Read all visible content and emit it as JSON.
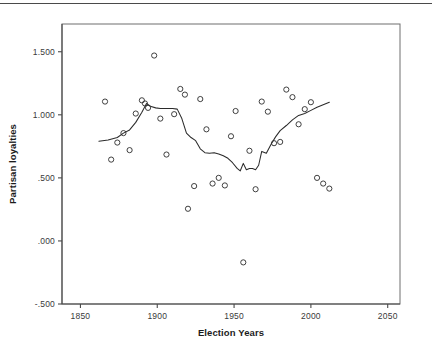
{
  "figure": {
    "background_color": "#ffffff",
    "frame_color": "#6e6e6e",
    "marker_color": "#2b2b2b",
    "line_color": "#2b2b2b"
  },
  "axes": {
    "x_title": "Election Years",
    "y_title": "Partisan loyalties",
    "x_ticks": [
      "1850",
      "1900",
      "1950",
      "2000",
      "2050"
    ],
    "y_ticks": [
      "1.500",
      "1.000",
      ".500",
      ".000",
      "-.500"
    ]
  },
  "chart_data": {
    "type": "scatter",
    "title": "",
    "xlabel": "Election Years",
    "ylabel": "Partisan loyalties",
    "xlim": [
      1838,
      2058
    ],
    "ylim": [
      -0.5,
      1.72
    ],
    "xticks": [
      1850,
      1900,
      1950,
      2000,
      2050
    ],
    "yticks": [
      -0.5,
      0.0,
      0.5,
      1.0,
      1.5
    ],
    "ytick_labels": [
      "-.500",
      ".000",
      ".500",
      "1.000",
      "1.500"
    ],
    "xtick_labels": [
      "1850",
      "1900",
      "1950",
      "2000",
      "2050"
    ],
    "grid": false,
    "legend": "none",
    "series": [
      {
        "name": "Partisan loyalties (observed)",
        "type": "scatter",
        "marker": "open-circle",
        "x": [
          1866,
          1870,
          1874,
          1878,
          1882,
          1886,
          1890,
          1892,
          1894,
          1898,
          1902,
          1906,
          1911,
          1915,
          1918,
          1920,
          1924,
          1928,
          1932,
          1936,
          1940,
          1944,
          1948,
          1951,
          1956,
          1960,
          1964,
          1968,
          1972,
          1976,
          1980,
          1984,
          1988,
          1992,
          1996,
          2000,
          2004,
          2008,
          2012
        ],
        "y": [
          1.105,
          0.645,
          0.78,
          0.855,
          0.72,
          1.01,
          1.115,
          1.09,
          1.055,
          1.47,
          0.97,
          0.685,
          1.005,
          1.205,
          1.16,
          0.255,
          0.435,
          1.125,
          0.885,
          0.455,
          0.5,
          0.44,
          0.83,
          1.03,
          -0.17,
          0.715,
          0.41,
          1.105,
          1.025,
          0.775,
          0.785,
          1.2,
          1.14,
          0.925,
          1.045,
          1.1,
          0.5,
          0.455,
          0.415
        ]
      },
      {
        "name": "Smoothed trend",
        "type": "line",
        "x": [
          1862,
          1868,
          1874,
          1878,
          1882,
          1886,
          1890,
          1893,
          1896,
          1899,
          1902,
          1906,
          1910,
          1913,
          1916,
          1919,
          1922,
          1925,
          1928,
          1931,
          1934,
          1937,
          1940,
          1943,
          1946,
          1949,
          1952,
          1954,
          1956,
          1958,
          1960,
          1962,
          1964,
          1966,
          1968,
          1971,
          1974,
          1977,
          1980,
          1984,
          1988,
          1992,
          1996,
          2000,
          2004,
          2008,
          2012
        ],
        "y": [
          0.79,
          0.8,
          0.82,
          0.855,
          0.88,
          0.94,
          1.02,
          1.09,
          1.065,
          1.055,
          1.05,
          1.05,
          1.05,
          1.045,
          0.97,
          0.855,
          0.82,
          0.795,
          0.73,
          0.7,
          0.695,
          0.7,
          0.69,
          0.675,
          0.655,
          0.62,
          0.575,
          0.555,
          0.615,
          0.565,
          0.575,
          0.575,
          0.565,
          0.6,
          0.71,
          0.695,
          0.765,
          0.825,
          0.875,
          0.915,
          0.96,
          0.995,
          1.01,
          1.035,
          1.06,
          1.08,
          1.1
        ]
      }
    ]
  }
}
